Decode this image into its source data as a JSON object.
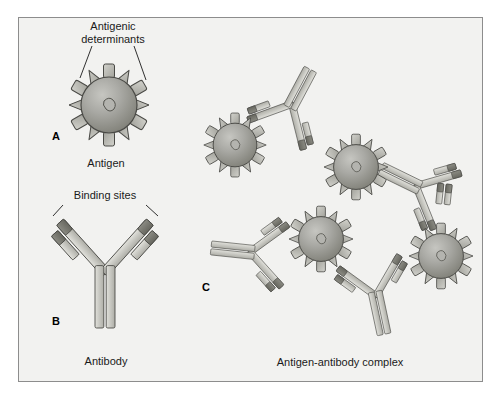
{
  "figure": {
    "background_color": "#f2f2f0",
    "frame_border_color": "#8d8d8d",
    "page_background": "#ffffff"
  },
  "colors": {
    "antigen_fill_light": "#b9b9b4",
    "antigen_fill_dark": "#8e8e89",
    "spike_fill": "#c3c3bd",
    "spike_stroke": "#5d5d58",
    "chain_light": "#d6d6d0",
    "chain_mid": "#bdbdb7",
    "binding_site_dark": "#77776f",
    "outline": "#4a4a46",
    "label_text": "#1a1a1a"
  },
  "panels": [
    {
      "id": "A",
      "letter": "A",
      "letter_pos": {
        "x": 57,
        "y": 136
      },
      "caption": "Antigen",
      "caption_pos": {
        "x": 105,
        "y": 165
      },
      "callout_label": "Antigenic\ndeterminants",
      "callout_line1": "Antigenic",
      "callout_line2": "determinants",
      "callout_pos": {
        "x": 113,
        "y": 34
      },
      "antigen": {
        "cx": 109,
        "cy": 105,
        "r": 28,
        "spike_count": 12
      }
    },
    {
      "id": "B",
      "letter": "B",
      "letter_pos": {
        "x": 57,
        "y": 320
      },
      "caption": "Antibody",
      "caption_pos": {
        "x": 105,
        "y": 363
      },
      "callout_label": "Binding sites",
      "callout_pos": {
        "x": 105,
        "y": 196
      },
      "antibody": {
        "cx": 105,
        "cy": 280,
        "rotation": 0,
        "scale": 1.0
      }
    },
    {
      "id": "C",
      "letter": "C",
      "letter_pos": {
        "x": 205,
        "y": 287
      },
      "caption": "Antigen-antibody complex",
      "caption_pos": {
        "x": 340,
        "y": 364
      },
      "antigen_count": 4,
      "antibody_count": 5
    }
  ],
  "complex": {
    "antigens": [
      {
        "name": "antigen-top-left",
        "cx": 235,
        "cy": 145,
        "r": 22,
        "spikes": 12
      },
      {
        "name": "antigen-top-right",
        "cx": 355,
        "cy": 165,
        "r": 22,
        "spikes": 12
      },
      {
        "name": "antigen-bottom-left",
        "cx": 320,
        "cy": 238,
        "r": 22,
        "spikes": 12
      },
      {
        "name": "antigen-bottom-right",
        "cx": 440,
        "cy": 255,
        "r": 22,
        "spikes": 12
      }
    ],
    "antibodies": [
      {
        "name": "antibody-top-center",
        "cx": 288,
        "cy": 110,
        "rotation": 205,
        "scale": 0.56
      },
      {
        "name": "antibody-right-upper",
        "cx": 414,
        "cy": 180,
        "rotation": 110,
        "scale": 0.56
      },
      {
        "name": "antibody-left-free",
        "cx": 248,
        "cy": 258,
        "rotation": 95,
        "scale": 0.56
      },
      {
        "name": "antibody-bottom",
        "cx": 378,
        "cy": 290,
        "rotation": 350,
        "scale": 0.56
      },
      {
        "name": "antibody-right-lower",
        "cx": 455,
        "cy": 205,
        "rotation": 180,
        "scale": 0.4
      }
    ]
  },
  "labels": {
    "antigenic_determinants_line1": "Antigenic",
    "antigenic_determinants_line2": "determinants",
    "antigen": "Antigen",
    "binding_sites": "Binding sites",
    "antibody": "Antibody",
    "antigen_antibody_complex": "Antigen-antibody complex",
    "letter_a": "A",
    "letter_b": "B",
    "letter_c": "C"
  }
}
